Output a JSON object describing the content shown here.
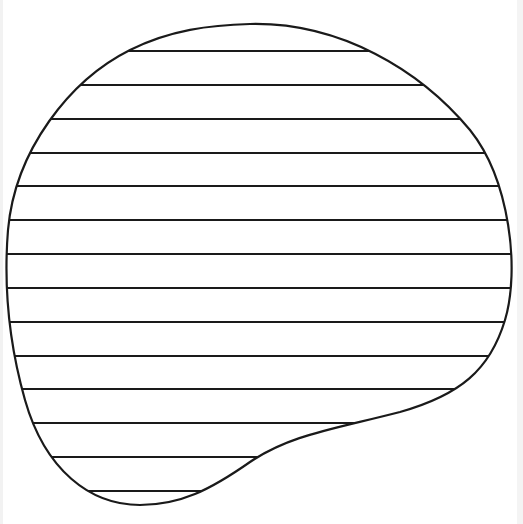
{
  "figure": {
    "stroke_color": "#1a1a1a",
    "background_color": "#ffffff",
    "hatch": {
      "orientation": "horizontal",
      "count": 14,
      "y_positions": [
        51,
        85,
        119,
        153,
        186,
        220,
        254,
        288,
        322,
        356,
        389,
        423,
        457,
        491
      ]
    }
  }
}
